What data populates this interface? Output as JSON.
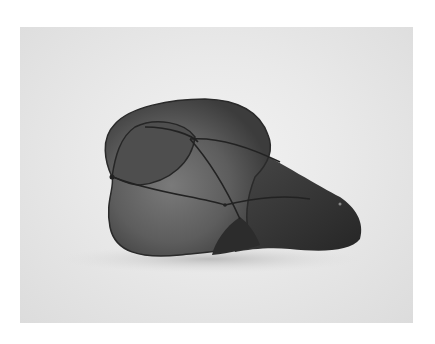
{
  "image": {
    "subject": "wire-frame mesh sculpture",
    "description": "Grayscale photograph of a translucent dark mesh sculpture stretched over curved wire ribs, resting on a white surface",
    "colors": {
      "page_background": "#ffffff",
      "photo_background": "#e9e9e9",
      "mesh_light": "#6e6e6e",
      "mesh_dark": "#3a3a3a",
      "wire": "#2a2a2a",
      "shadow": "#bdbdbd"
    }
  }
}
